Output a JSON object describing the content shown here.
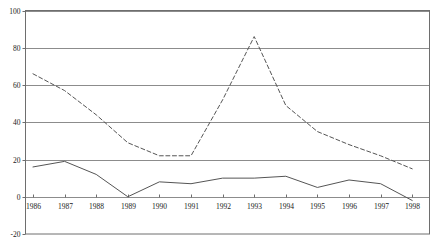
{
  "chart_data": {
    "type": "line",
    "title": "",
    "xlabel": "",
    "ylabel": "",
    "categories": [
      "1986",
      "1987",
      "1988",
      "1989",
      "1990",
      "1991",
      "1992",
      "1993",
      "1994",
      "1995",
      "1996",
      "1997",
      "1998"
    ],
    "x": [
      1986,
      1987,
      1988,
      1989,
      1990,
      1991,
      1992,
      1993,
      1994,
      1995,
      1996,
      1997,
      1998
    ],
    "series": [
      {
        "name": "dashed-series",
        "style": "dashed",
        "color": "#555555",
        "values": [
          66,
          57,
          44,
          29,
          22,
          22,
          52,
          86,
          49,
          35,
          28,
          22,
          15
        ]
      },
      {
        "name": "solid-series",
        "style": "solid",
        "color": "#555555",
        "values": [
          16,
          19,
          12,
          0,
          8,
          7,
          10,
          10,
          11,
          5,
          9,
          7,
          -2
        ]
      }
    ],
    "ylim": [
      -20,
      100
    ],
    "yticks": [
      -20,
      0,
      20,
      40,
      60,
      80,
      100
    ],
    "ytick_labels": [
      "-20",
      "0",
      "20",
      "40",
      "60",
      "80",
      "100"
    ],
    "xlim": [
      1985.75,
      1998.5
    ],
    "grid": true,
    "grid_axis": "y",
    "legend": "none",
    "frame": true
  },
  "figure": {
    "background": "#ffffff",
    "frame_color": "#6e6e6e",
    "grid_color": "#8c8c8c",
    "tick_color": "#6e6e6e",
    "text_color": "#1a1a1a"
  }
}
